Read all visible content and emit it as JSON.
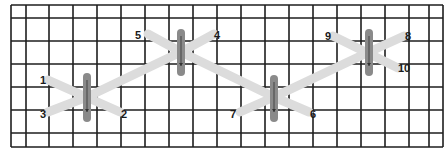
{
  "diagram": {
    "type": "stitch-pattern-grid",
    "colors": {
      "grid": "#1e1e1e",
      "thread": "#dcdcdc",
      "bar": "#8a8a8a",
      "arrow": "#333333",
      "label": "#1a1a1a"
    },
    "grid": {
      "cols_x": [
        11,
        26,
        49,
        73,
        97,
        121,
        145,
        169,
        193,
        217,
        241,
        265,
        289,
        313,
        337,
        361,
        385,
        409,
        429,
        443
      ],
      "rows_y": [
        5,
        18,
        41,
        64,
        87,
        110,
        133,
        147
      ]
    },
    "stitch_groups": [
      {
        "center": [
          87,
          97
        ],
        "bar": {
          "x": 87,
          "y1": 77,
          "y2": 118
        }
      },
      {
        "center": [
          181,
          52
        ],
        "bar": {
          "x": 181,
          "y1": 33,
          "y2": 72
        }
      },
      {
        "center": [
          274,
          97
        ],
        "bar": {
          "x": 274,
          "y1": 79,
          "y2": 118
        }
      },
      {
        "center": [
          369,
          52
        ],
        "bar": {
          "x": 369,
          "y1": 33,
          "y2": 72
        }
      }
    ],
    "points": [
      {
        "label": "1",
        "x": 48,
        "y": 80
      },
      {
        "label": "2",
        "x": 120,
        "y": 112
      },
      {
        "label": "3",
        "x": 48,
        "y": 112
      },
      {
        "label": "4",
        "x": 214,
        "y": 34
      },
      {
        "label": "5",
        "x": 148,
        "y": 34
      },
      {
        "label": "6",
        "x": 309,
        "y": 112
      },
      {
        "label": "7",
        "x": 240,
        "y": 112
      },
      {
        "label": "8",
        "x": 404,
        "y": 36
      },
      {
        "label": "9",
        "x": 333,
        "y": 36
      },
      {
        "label": "10",
        "x": 398,
        "y": 68
      }
    ],
    "labels": [
      {
        "text": "1",
        "x": 40,
        "y": 84
      },
      {
        "text": "2",
        "x": 121,
        "y": 118
      },
      {
        "text": "3",
        "x": 40,
        "y": 118
      },
      {
        "text": "4",
        "x": 214,
        "y": 39
      },
      {
        "text": "5",
        "x": 135,
        "y": 39
      },
      {
        "text": "6",
        "x": 310,
        "y": 118
      },
      {
        "text": "7",
        "x": 230,
        "y": 118
      },
      {
        "text": "8",
        "x": 405,
        "y": 40
      },
      {
        "text": "9",
        "x": 325,
        "y": 40
      },
      {
        "text": "10",
        "x": 398,
        "y": 72
      }
    ]
  }
}
